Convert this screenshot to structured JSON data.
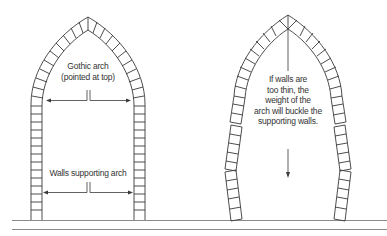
{
  "diagram": {
    "left_arch": {
      "title_line1": "Gothic arch",
      "title_line2": "(pointed at top)",
      "walls_label": "Walls supporting arch"
    },
    "right_arch": {
      "caption_lines": [
        "If walls are",
        "too thin, the",
        "weight of the",
        "arch will buckle the",
        "supporting walls."
      ]
    },
    "colors": {
      "line": "#3a3a3a",
      "text": "#333333",
      "ground": "#888888",
      "background": "#ffffff"
    }
  }
}
